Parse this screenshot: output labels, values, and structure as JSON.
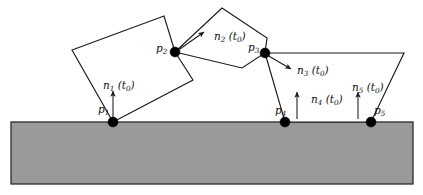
{
  "figure": {
    "background_color": "#ffffff",
    "ground_color": "#9a9a9a",
    "ground_border_color": "#2b2b2b",
    "line_color": "#1a1a1a",
    "dot_color": "#000000"
  },
  "labels": {
    "n1": {
      "sym": "n",
      "idx": "1",
      "arg": " (t",
      "argsub": "0",
      "argend": ")"
    },
    "n2": {
      "sym": "n",
      "idx": "2",
      "arg": " (t",
      "argsub": "0",
      "argend": ")"
    },
    "n3": {
      "sym": "n",
      "idx": "3",
      "arg": " (t",
      "argsub": "0",
      "argend": ")"
    },
    "n4": {
      "sym": "n",
      "idx": "4",
      "arg": " (t",
      "argsub": "0",
      "argend": ")"
    },
    "n5": {
      "sym": "n",
      "idx": "5",
      "arg": " (t",
      "argsub": "0",
      "argend": ")"
    },
    "p1": {
      "sym": "p",
      "idx": "1"
    },
    "p2": {
      "sym": "p",
      "idx": "2"
    },
    "p3": {
      "sym": "p",
      "idx": "3"
    },
    "p4": {
      "sym": "p",
      "idx": "4"
    },
    "p5": {
      "sym": "p",
      "idx": "5"
    }
  },
  "label_positions": {
    "n1": {
      "x": 103,
      "y": 80
    },
    "n2": {
      "x": 214,
      "y": 31
    },
    "n3": {
      "x": 297,
      "y": 65
    },
    "n4": {
      "x": 311,
      "y": 94
    },
    "n5": {
      "x": 352,
      "y": 82
    },
    "p1": {
      "x": 98,
      "y": 104
    },
    "p2": {
      "x": 156,
      "y": 43
    },
    "p3": {
      "x": 248,
      "y": 42
    },
    "p4": {
      "x": 275,
      "y": 105
    },
    "p5": {
      "x": 374,
      "y": 105
    }
  },
  "geometry": {
    "ground": {
      "x": 11,
      "y": 122,
      "width": 402,
      "height": 62
    },
    "polygon1_points": "164,16 72,50 113,122 193,80",
    "polygon1_extra_edge": "175,52 193,80",
    "polygon1_top_right_edge": "164,16 175,52",
    "polygon2_points": "175,52 222,8 267,38 242,68",
    "polygon3_points": "265,53 404,53 371,122 285,122",
    "contact_points": [
      {
        "name": "p1",
        "x": 113,
        "y": 122,
        "r": 5.0
      },
      {
        "name": "p2",
        "x": 175,
        "y": 52,
        "r": 5.0
      },
      {
        "name": "p3",
        "x": 265,
        "y": 53,
        "r": 5.0
      },
      {
        "name": "p4",
        "x": 285,
        "y": 122,
        "r": 5.0
      },
      {
        "name": "p5",
        "x": 371,
        "y": 122,
        "r": 5.0
      }
    ],
    "normals": [
      {
        "name": "n1",
        "x1": 113,
        "y1": 119,
        "x2": 113,
        "y2": 91,
        "dir": "up"
      },
      {
        "name": "n2",
        "x1": 177,
        "y1": 51,
        "x2": 204,
        "y2": 32,
        "dir": "up-right"
      },
      {
        "name": "n3",
        "x1": 267,
        "y1": 55,
        "x2": 291,
        "y2": 69,
        "dir": "down-right"
      },
      {
        "name": "n4",
        "x1": 297,
        "y1": 119,
        "x2": 297,
        "y2": 92,
        "dir": "up"
      },
      {
        "name": "n5",
        "x1": 358,
        "y1": 119,
        "x2": 358,
        "y2": 92,
        "dir": "up"
      }
    ]
  }
}
